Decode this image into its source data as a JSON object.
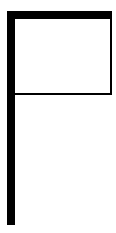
{
  "figure": {
    "colors": {
      "stroke": "#000000",
      "fill": "#ffffff",
      "background": "#ffffff"
    }
  }
}
